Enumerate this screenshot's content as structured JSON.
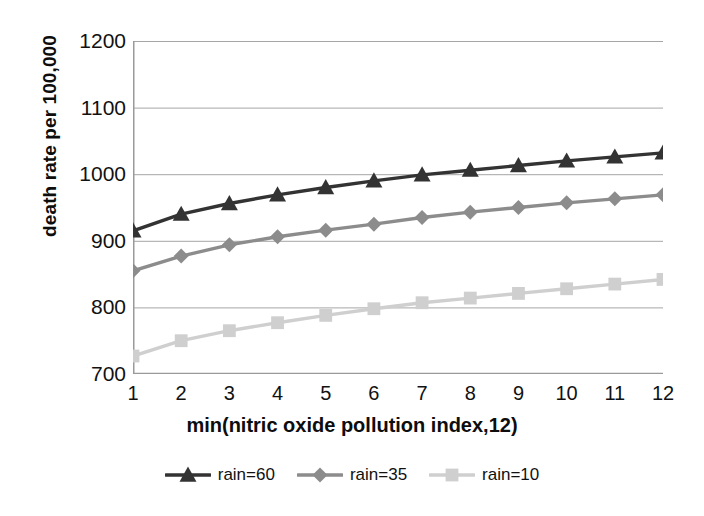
{
  "chart_data": {
    "type": "line",
    "title": "",
    "xlabel": "min(nitric oxide pollution index,12)",
    "ylabel": "death rate per 100,000",
    "x": [
      1,
      2,
      3,
      4,
      5,
      6,
      7,
      8,
      9,
      10,
      11,
      12
    ],
    "xtick_labels": [
      "1",
      "2",
      "3",
      "4",
      "5",
      "6",
      "7",
      "8",
      "9",
      "10",
      "11",
      "12"
    ],
    "ytick_labels": [
      "1200",
      "1100",
      "1000",
      "900",
      "800",
      "700"
    ],
    "yticks": [
      1200,
      1100,
      1000,
      900,
      800,
      700
    ],
    "xlim": [
      1,
      12
    ],
    "ylim": [
      700,
      1200
    ],
    "grid": "horizontal",
    "legend_position": "bottom",
    "series": [
      {
        "name": "rain=60",
        "marker": "triangle",
        "color": "#333333",
        "values": [
          915,
          940,
          956,
          969,
          980,
          990,
          999,
          1006,
          1013,
          1020,
          1026,
          1032
        ]
      },
      {
        "name": "rain=35",
        "marker": "diamond",
        "color": "#8c8c8c",
        "values": [
          855,
          877,
          894,
          906,
          916,
          925,
          935,
          943,
          950,
          957,
          963,
          969
        ]
      },
      {
        "name": "rain=10",
        "marker": "square",
        "color": "#cfcfcf",
        "values": [
          727,
          750,
          765,
          777,
          788,
          798,
          807,
          814,
          821,
          828,
          835,
          842
        ]
      }
    ]
  },
  "axis_color": "#9a9a9a",
  "grid_color": "#a6a6a6"
}
